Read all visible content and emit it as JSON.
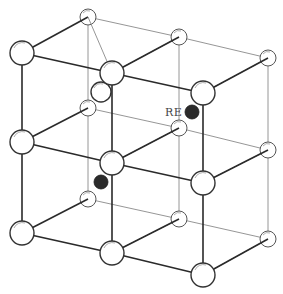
{
  "diagram": {
    "label_re": "RE",
    "colors": {
      "atom_fill": "#ffffff",
      "atom_stroke": "#333333",
      "dopant_fill": "#2b2b2b",
      "front_bond": "#2a2a2a",
      "back_bond": "#8a8a8a"
    },
    "atoms": {
      "front_layer": [
        {
          "id": "f-top-left",
          "x": 22,
          "y": 53,
          "r": 12
        },
        {
          "id": "f-top-mid",
          "x": 112,
          "y": 73,
          "r": 12
        },
        {
          "id": "f-top-right",
          "x": 203,
          "y": 93,
          "r": 12
        },
        {
          "id": "f-mid-left",
          "x": 22,
          "y": 142,
          "r": 12
        },
        {
          "id": "f-mid-mid",
          "x": 112,
          "y": 163,
          "r": 12
        },
        {
          "id": "f-mid-right",
          "x": 203,
          "y": 183,
          "r": 12
        },
        {
          "id": "f-bot-left",
          "x": 22,
          "y": 233,
          "r": 12
        },
        {
          "id": "f-bot-mid",
          "x": 112,
          "y": 253,
          "r": 12
        },
        {
          "id": "f-bot-right",
          "x": 203,
          "y": 275,
          "r": 12
        }
      ],
      "back_layer": [
        {
          "id": "b-top-left",
          "x": 88,
          "y": 17,
          "r": 8
        },
        {
          "id": "b-top-mid",
          "x": 179,
          "y": 37,
          "r": 8
        },
        {
          "id": "b-top-right",
          "x": 268,
          "y": 58,
          "r": 8
        },
        {
          "id": "b-mid-left",
          "x": 88,
          "y": 108,
          "r": 8
        },
        {
          "id": "b-mid-mid",
          "x": 179,
          "y": 128,
          "r": 8
        },
        {
          "id": "b-mid-right",
          "x": 268,
          "y": 150,
          "r": 8
        },
        {
          "id": "b-bot-left",
          "x": 88,
          "y": 199,
          "r": 8
        },
        {
          "id": "b-bot-mid",
          "x": 179,
          "y": 219,
          "r": 8
        },
        {
          "id": "b-bot-right",
          "x": 268,
          "y": 239,
          "r": 8
        }
      ],
      "middle_layer": [
        {
          "id": "m-top-mid",
          "x": 101,
          "y": 92,
          "r": 10
        }
      ],
      "dopants": [
        {
          "id": "re-upper",
          "x": 192,
          "y": 112,
          "r": 7
        },
        {
          "id": "re-lower",
          "x": 101,
          "y": 182,
          "r": 7
        }
      ]
    },
    "label_position": {
      "x": 166,
      "y": 116
    }
  }
}
